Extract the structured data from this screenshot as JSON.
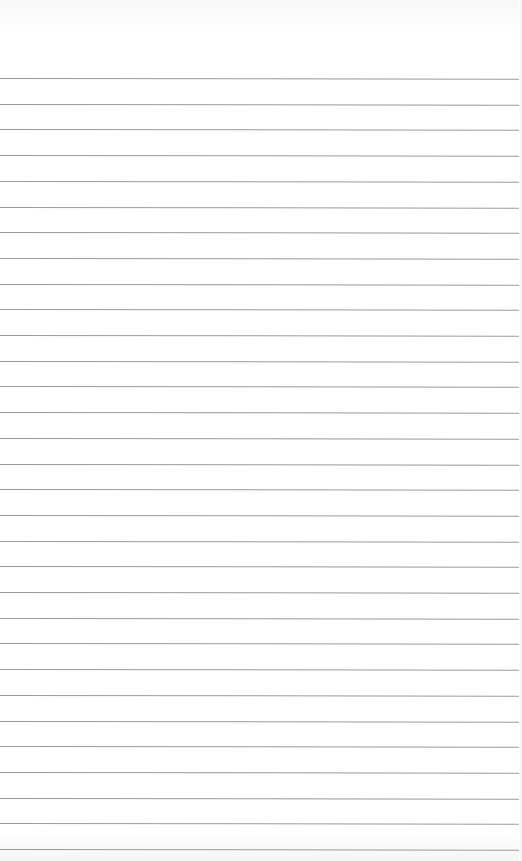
{
  "page": {
    "type": "lined-paper",
    "background_color": "#ffffff",
    "rule_color": "#9a9a9a",
    "first_rule_y": 78,
    "rule_spacing": 25.7,
    "rule_count": 31
  }
}
